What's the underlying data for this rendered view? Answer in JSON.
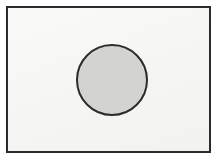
{
  "figure": {
    "background_color": "#ffffff",
    "frame": {
      "name": "rectangle-frame",
      "fill_color": "#f7f7f5",
      "stroke_color": "#2b2b2b",
      "stroke_width_px": 2,
      "x": 6,
      "y": 6,
      "width": 205,
      "height": 147
    },
    "shape": {
      "name": "circle",
      "type": "circle",
      "fill_color": "#d3d3d1",
      "stroke_color": "#2b2b2b",
      "stroke_width_px": 2,
      "center_x": 110,
      "center_y": 78,
      "diameter": 72,
      "radius": 36
    },
    "labels": []
  }
}
